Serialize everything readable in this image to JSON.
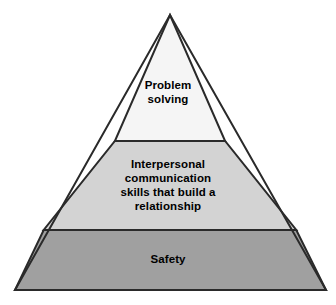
{
  "figure": {
    "type": "pyramid-diagram",
    "background_color": "#ffffff",
    "outline_color": "#2a2a2a",
    "text_color": "#000000"
  },
  "pyramid": {
    "apex": {
      "x": 170,
      "y": 15
    },
    "base_left": {
      "x": 15,
      "y": 290
    },
    "base_right": {
      "x": 326,
      "y": 290
    },
    "divider_y": [
      141,
      230
    ],
    "tiers": [
      {
        "position": "top",
        "label": "Problem\nsolving",
        "fill_color": "#f5f5f5"
      },
      {
        "position": "middle",
        "label": "Interpersonal\ncommunication\nskills that build a\nrelationship",
        "fill_color": "#d3d3d3"
      },
      {
        "position": "bottom",
        "label": "Safety",
        "fill_color": "#a0a0a0"
      }
    ]
  }
}
